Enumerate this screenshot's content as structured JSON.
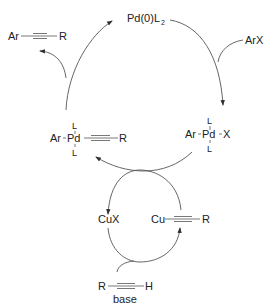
{
  "diagram": {
    "type": "catalytic cycle",
    "pd_cycle": {
      "catalyst": {
        "main": "Pd(0)L",
        "subscript": "2"
      },
      "reagent_in": "ArX",
      "oxidative_addition_complex": {
        "left": "Ar",
        "center": "Pd",
        "right": "X",
        "top_ligand": "L",
        "bottom_ligand": "L"
      },
      "transmetalation_complex": {
        "left": "Ar",
        "center": "Pd",
        "right": "R",
        "top_ligand": "L",
        "bottom_ligand": "L"
      },
      "product": {
        "left": "Ar",
        "right": "R"
      }
    },
    "cu_cycle": {
      "copper_salt": "CuX",
      "copper_acetylide": {
        "left": "Cu",
        "right": "R"
      },
      "alkyne": {
        "left": "R",
        "right": "H"
      },
      "base": "base"
    }
  }
}
